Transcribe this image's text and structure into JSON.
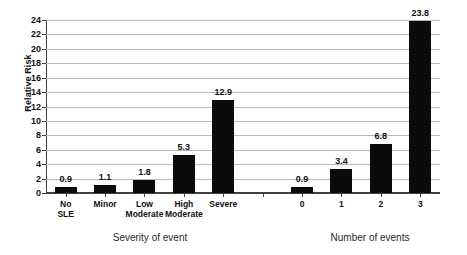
{
  "chart_data": {
    "type": "bar",
    "title": "",
    "subtitle": "",
    "xlabel": "",
    "ylabel": "Relative Risk",
    "ylim": [
      0,
      24
    ],
    "ytick_step": 2,
    "yticks": [
      "0",
      "2",
      "4",
      "6",
      "8",
      "10",
      "12",
      "14",
      "16",
      "18",
      "20",
      "22",
      "24"
    ],
    "grid": true,
    "legend": "none",
    "bar_color": "#0b0b0b",
    "categories": [
      "No SLE",
      "Minor",
      "Low\nModerate",
      "High\nModerate",
      "Severe",
      "",
      "0",
      "1",
      "2",
      "3"
    ],
    "values": [
      0.9,
      1.1,
      1.8,
      5.3,
      12.9,
      null,
      0.9,
      3.4,
      6.8,
      23.8
    ],
    "data_labels": [
      "0.9",
      "1.1",
      "1.8",
      "5.3",
      "12.9",
      "",
      "0.9",
      "3.4",
      "6.8",
      "23.8"
    ],
    "groups": [
      {
        "name": "Severity of event",
        "categories": [
          "No SLE",
          "Minor",
          "Low Moderate",
          "High Moderate",
          "Severe"
        ],
        "values": [
          0.9,
          1.1,
          1.8,
          5.3,
          12.9
        ]
      },
      {
        "name": "Number of events",
        "categories": [
          "0",
          "1",
          "2",
          "3"
        ],
        "values": [
          0.9,
          3.4,
          6.8,
          23.8
        ]
      }
    ]
  },
  "axis": {
    "y_title": "Relative Risk"
  },
  "group_titles": {
    "left": "Severity of event",
    "right": "Number of events"
  }
}
